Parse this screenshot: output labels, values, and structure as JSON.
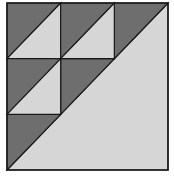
{
  "diagram": {
    "colors": {
      "dark": "#6e6e6e",
      "light": "#d6d6d6",
      "line": "#1a1a1a",
      "background": "#ffffff"
    },
    "grid": {
      "rows": 3,
      "cols": 3
    },
    "bounds": {
      "x0": 7,
      "y0": 3,
      "x1": 168,
      "y1": 170
    },
    "split_cells": [
      {
        "row": 0,
        "col": 0
      },
      {
        "row": 0,
        "col": 1
      },
      {
        "row": 1,
        "col": 0
      }
    ],
    "large_triangle": "lower-right light triangle below main diagonal"
  }
}
